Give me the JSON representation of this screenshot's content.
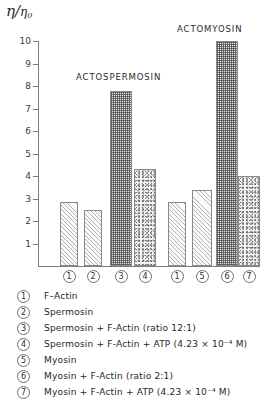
{
  "axis": {
    "y_label_numerator": "η",
    "y_label_denominator": "η",
    "y_label_subscript": "0",
    "tick_labels": [
      "10",
      "9",
      "8",
      "7",
      "6",
      "5",
      "4",
      "3",
      "2",
      "1"
    ]
  },
  "groups": [
    {
      "title": "ACTOSPERMOSIN"
    },
    {
      "title": "ACTOMYOSIN"
    }
  ],
  "markers": [
    "1",
    "2",
    "3",
    "4",
    "1",
    "5",
    "6",
    "7"
  ],
  "legend": [
    {
      "num": "1",
      "text": "F–Actin"
    },
    {
      "num": "2",
      "text": "Spermosin"
    },
    {
      "num": "3",
      "text": "Spermosin  +  F-Actin (ratio  12:1)"
    },
    {
      "num": "4",
      "text": "Spermosin  +  F-Actin + ATP (4.23 × 10⁻⁴ M)"
    },
    {
      "num": "5",
      "text": "Myosin"
    },
    {
      "num": "6",
      "text": "Myosin  +  F-Actin (ratio  2:1)"
    },
    {
      "num": "7",
      "text": "Myosin  +  F-Actin + ATP (4.23 × 10⁻⁴ M)"
    }
  ],
  "chart_data": {
    "type": "bar",
    "title": "",
    "xlabel": "",
    "ylabel": "η/η₀",
    "ylim": [
      1,
      10
    ],
    "grid": false,
    "legend_position": "below-plot",
    "categories": [
      "1",
      "2",
      "3",
      "4",
      "1",
      "5",
      "6",
      "7"
    ],
    "category_labels": [
      "F–Actin",
      "Spermosin",
      "Spermosin + F-Actin (ratio 12:1)",
      "Spermosin + F-Actin + ATP (4.23 × 10⁻⁴ M)",
      "F–Actin",
      "Myosin",
      "Myosin + F-Actin (ratio 2:1)",
      "Myosin + F-Actin + ATP (4.23 × 10⁻⁴ M)"
    ],
    "group_names": [
      "ACTOSPERMOSIN",
      "ACTOSPERMOSIN",
      "ACTOSPERMOSIN",
      "ACTOSPERMOSIN",
      "ACTOMYOSIN",
      "ACTOMYOSIN",
      "ACTOMYOSIN",
      "ACTOMYOSIN"
    ],
    "values": [
      2.85,
      2.5,
      7.8,
      4.3,
      2.85,
      3.4,
      10.0,
      4.0
    ],
    "fill_patterns": [
      "hatch",
      "hatch",
      "checker",
      "stipple",
      "hatch",
      "hatch",
      "checker",
      "stipple"
    ]
  }
}
